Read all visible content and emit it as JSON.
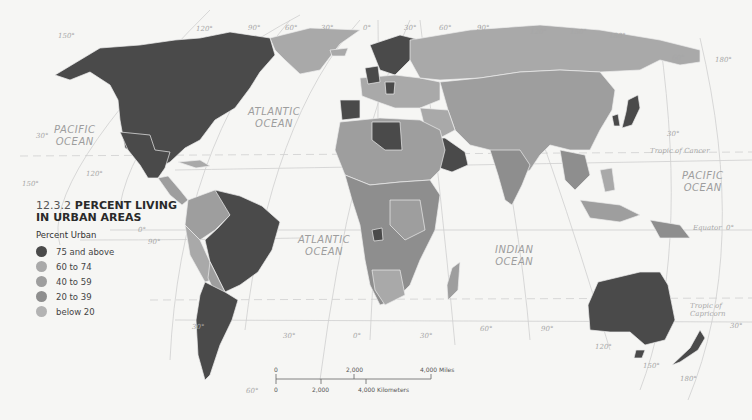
{
  "title": {
    "number": "12.3.2",
    "line1": "PERCENT LIVING",
    "line2": "IN URBAN AREAS"
  },
  "legend": {
    "subtitle": "Percent Urban",
    "items": [
      {
        "label": "75 and above",
        "color": "#4a4a4a"
      },
      {
        "label": "60 to 74",
        "color": "#a9a9a9"
      },
      {
        "label": "40 to 59",
        "color": "#9e9e9e"
      },
      {
        "label": "20 to 39",
        "color": "#8e8e8e"
      },
      {
        "label": "below 20",
        "color": "#b3b3b3"
      }
    ]
  },
  "oceans": [
    {
      "name": "PACIFIC OCEAN",
      "line1": "PACIFIC",
      "line2": "OCEAN"
    },
    {
      "name": "ATLANTIC OCEAN",
      "line1": "ATLANTIC",
      "line2": "OCEAN"
    },
    {
      "name": "ATLANTIC OCEAN",
      "line1": "ATLANTIC",
      "line2": "OCEAN"
    },
    {
      "name": "INDIAN OCEAN",
      "line1": "INDIAN",
      "line2": "OCEAN"
    },
    {
      "name": "PACIFIC OCEAN",
      "line1": "PACIFIC",
      "line2": "OCEAN"
    }
  ],
  "reference_lines": {
    "tropic_of_cancer": "Tropic of Cancer",
    "equator": "Equator",
    "tropic_of_capricorn": "Tropic of Capricorn"
  },
  "grid_labels": {
    "top": [
      "150°",
      "120°",
      "90°",
      "60°",
      "30°",
      "0°",
      "30°",
      "60°",
      "90°",
      "120°",
      "150°",
      "180°"
    ],
    "lat_left_30n": "30°",
    "lat_left_0": "0°",
    "lat_right_60n": "60°",
    "lat_right_30n": "30°",
    "lat_right_0": "0°",
    "lat_right_30s": "30°",
    "lat_left_30s": "30°",
    "lon_120w": "120°",
    "lon_150w": "150°",
    "lon_90w": "90°",
    "lon_180e_top": "180°",
    "bottom": [
      "60°",
      "30°",
      "0°",
      "30°",
      "60°",
      "90°",
      "120°",
      "150°",
      "180°"
    ]
  },
  "scale_bar": {
    "miles": [
      "0",
      "2,000",
      "4,000 Miles"
    ],
    "kilometers": [
      "0",
      "2,000",
      "4,000 Kilometers"
    ]
  },
  "colors": {
    "background": "#f6f6f4",
    "high": "#4a4a4a",
    "mid_high": "#a9a9a9",
    "mid": "#9e9e9e",
    "low": "#8e8e8e",
    "lowest": "#b3b3b3",
    "grid": "#cfcfcf",
    "border": "#e8e8e8"
  }
}
